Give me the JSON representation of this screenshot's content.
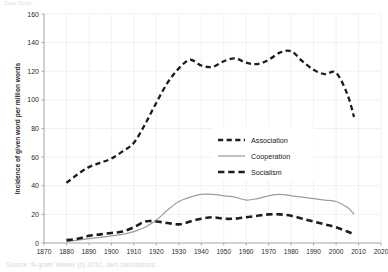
{
  "watermark": {
    "top_text": "Case Study",
    "bottom_caption": "Source: N-gram Viewer (c) 2010, own calculations"
  },
  "chart_data": {
    "type": "line",
    "title": "",
    "xlabel": "",
    "ylabel": "Incidence of given word per million words",
    "xlim": [
      1870,
      2020
    ],
    "ylim": [
      0,
      160
    ],
    "grid": true,
    "legend_position": "center-right",
    "xticks": [
      1870,
      1880,
      1890,
      1900,
      1910,
      1920,
      1930,
      1940,
      1950,
      1960,
      1970,
      1980,
      1990,
      2000,
      2010,
      2020
    ],
    "yticks": [
      0,
      20,
      40,
      60,
      80,
      100,
      120,
      140,
      160
    ],
    "x": [
      1880,
      1885,
      1890,
      1895,
      1900,
      1905,
      1910,
      1915,
      1920,
      1925,
      1930,
      1935,
      1940,
      1945,
      1950,
      1955,
      1960,
      1965,
      1970,
      1975,
      1980,
      1985,
      1990,
      1995,
      2000,
      2005,
      2008
    ],
    "series": [
      {
        "name": "Association",
        "style": "dashed-thin",
        "color": "#1d1d1d",
        "values": [
          42,
          48,
          53,
          56,
          59,
          64,
          70,
          83,
          98,
          112,
          122,
          128,
          124,
          123,
          127,
          129,
          126,
          125,
          128,
          133,
          134,
          127,
          121,
          118,
          119,
          104,
          88
        ]
      },
      {
        "name": "Cooperation",
        "style": "solid",
        "color": "#9c9c9c",
        "values": [
          1,
          2,
          3,
          4,
          5,
          6,
          8,
          11,
          16,
          23,
          29,
          32,
          34,
          34,
          33,
          32,
          30,
          31,
          33,
          34,
          33,
          32,
          31,
          30,
          29,
          25,
          20
        ]
      },
      {
        "name": "Socialism",
        "style": "dashed-thick",
        "color": "#1d1d1d",
        "values": [
          2,
          3,
          5,
          6,
          7,
          8,
          11,
          15,
          15,
          14,
          13,
          15,
          17,
          18,
          17,
          17,
          18,
          19,
          20,
          20,
          19,
          17,
          15,
          13,
          11,
          8,
          6
        ]
      }
    ]
  }
}
